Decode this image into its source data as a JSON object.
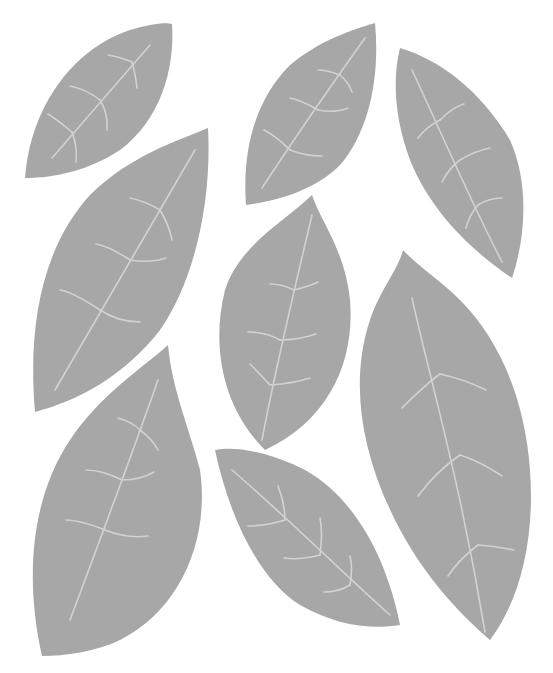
{
  "canvas": {
    "width": 553,
    "height": 673,
    "background": "#ffffff"
  },
  "colors": {
    "leaf_fill": "#a7a7a7",
    "vein": "#d2d2d2"
  },
  "leaves": [
    {
      "name": "leaf-top-left",
      "blade": "M25,178 C30,110 70,50 130,30 C150,24 165,22 172,24 C175,70 160,120 120,150 C90,170 55,178 25,178 Z",
      "veins": [
        "M52,158 L150,45",
        "M72,132 C62,124 55,118 48,114",
        "M72,132 C76,142 77,152 76,162",
        "M100,100 C90,92 80,88 70,86",
        "M100,100 C106,110 108,120 107,130",
        "M132,62 C122,58 115,56 108,55",
        "M132,62 C135,72 136,80 137,88"
      ]
    },
    {
      "name": "leaf-left-middle",
      "blade": "M35,412 C28,330 40,250 90,195 C130,155 180,140 208,128 C212,200 195,280 160,330 C125,375 80,400 35,412 Z",
      "veins": [
        "M55,390 L195,150",
        "M100,310 C85,300 72,292 60,290",
        "M100,310 C112,318 126,322 140,322",
        "M130,260 C118,252 106,246 96,244",
        "M130,260 C142,262 154,262 166,258",
        "M160,210 C150,204 140,200 130,198",
        "M160,210 C166,220 170,230 172,240"
      ]
    },
    {
      "name": "leaf-bottom-left",
      "blade": "M42,656 C25,580 30,500 70,440 C100,395 140,370 168,345 C172,390 190,430 200,470 C210,540 180,610 120,640 C95,652 65,656 42,656 Z",
      "veins": [
        "M70,620 C100,540 130,460 158,380",
        "M105,530 C90,524 78,520 66,520",
        "M105,530 C120,536 134,538 148,536",
        "M122,480 C110,474 98,470 86,470",
        "M122,480 C134,480 144,478 154,472",
        "M140,430 C134,424 126,420 118,418",
        "M140,430 C148,436 154,442 158,450"
      ]
    },
    {
      "name": "leaf-top-center",
      "blade": "M246,205 C242,150 255,100 290,65 C320,40 352,30 375,23 C380,75 370,130 340,165 C315,190 280,200 246,205 Z",
      "veins": [
        "M262,188 C300,130 335,80 365,38",
        "M290,150 C280,140 272,134 264,130",
        "M290,150 C300,154 310,156 322,156",
        "M318,110 C308,104 300,100 290,98",
        "M318,110 C328,112 338,112 348,108",
        "M340,75 C332,72 325,70 318,70",
        "M340,75 C346,80 350,86 352,92"
      ]
    },
    {
      "name": "leaf-center",
      "blade": "M265,450 C225,410 210,350 225,290 C240,245 280,225 312,195 C320,220 345,250 350,300 C355,360 330,420 265,450 Z",
      "veins": [
        "M262,440 C275,370 292,300 312,215",
        "M270,385 C262,376 256,370 250,364",
        "M270,385 C284,384 298,382 310,378",
        "M280,340 C270,334 260,332 248,332",
        "M280,340 C292,340 304,338 316,334",
        "M294,290 C286,286 278,284 270,284",
        "M294,290 C302,288 310,286 318,282"
      ]
    },
    {
      "name": "leaf-bottom-center",
      "blade": "M215,450 C240,445 275,455 305,470 C350,495 385,550 400,625 C370,630 335,625 300,605 C260,580 230,520 215,450 Z",
      "veins": [
        "M232,470 C290,520 345,575 390,615",
        "M285,520 C285,506 282,496 278,486",
        "M285,520 C272,524 260,526 248,526",
        "M320,555 C322,540 322,528 320,518",
        "M320,555 C308,558 296,560 284,558",
        "M350,585 C352,574 352,564 350,556",
        "M350,585 C342,590 334,592 324,592"
      ]
    },
    {
      "name": "leaf-top-right",
      "blade": "M400,48 C440,60 480,90 510,140 C530,185 525,240 512,278 C470,250 430,210 410,160 C395,120 392,80 400,48 Z",
      "veins": [
        "M412,70 C440,130 470,200 502,262",
        "M440,120 C448,112 456,106 464,104",
        "M440,120 C432,124 424,130 418,138",
        "M460,160 C470,154 480,150 490,148",
        "M460,160 C452,166 446,174 442,182",
        "M478,205 C486,200 494,198 502,198",
        "M478,205 C472,212 468,220 466,228"
      ]
    },
    {
      "name": "leaf-bottom-right",
      "blade": "M403,250 C398,270 380,290 370,320 C350,380 360,450 395,520 C420,570 455,610 490,640 C520,600 535,540 530,470 C525,400 500,340 460,300 C440,280 420,268 403,250 Z",
      "veins": [
        "M412,298 C430,380 460,480 485,632",
        "M440,374 C426,384 414,396 402,408",
        "M440,374 C458,378 474,384 486,390",
        "M460,455 C444,466 430,480 418,496",
        "M460,455 C476,460 490,468 502,476",
        "M478,545 C466,554 456,564 448,576",
        "M478,545 C492,546 504,548 514,550"
      ]
    }
  ]
}
